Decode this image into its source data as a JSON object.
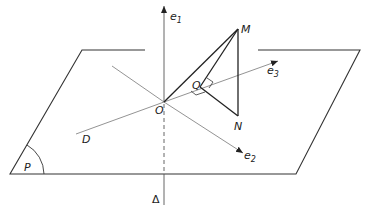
{
  "diagram": {
    "colors": {
      "line": "#2a2a2a",
      "thin": "#666666",
      "background": "#ffffff"
    },
    "labels": {
      "e1": "e",
      "e1_sub": "1",
      "e2": "e",
      "e2_sub": "2",
      "e3": "e",
      "e3_sub": "3",
      "M": "M",
      "N": "N",
      "Q": "Q",
      "O": "O",
      "D": "D",
      "P": "P",
      "Delta": "Δ"
    },
    "points": {
      "O": [
        164,
        102
      ],
      "M": [
        238,
        29
      ],
      "N": [
        238,
        116
      ],
      "Q": [
        200,
        87
      ]
    }
  }
}
